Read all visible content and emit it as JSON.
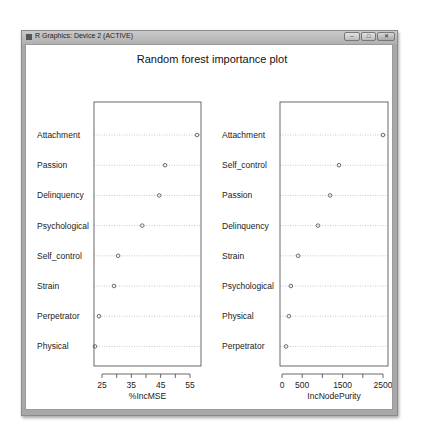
{
  "window": {
    "title": "R Graphics: Device 2 (ACTIVE)",
    "buttons": {
      "minimize": "–",
      "maximize": "□",
      "close": "✕"
    }
  },
  "chart_data": [
    {
      "type": "scatter",
      "subtype": "dotchart",
      "title": "Random forest importance plot",
      "xlabel": "%IncMSE",
      "ylabel": "",
      "categories": [
        "Attachment",
        "Passion",
        "Delinquency",
        "Psychological",
        "Self_control",
        "Strain",
        "Perpetrator",
        "Physical"
      ],
      "values": [
        57.4,
        46.5,
        44.5,
        38.7,
        30.5,
        29.1,
        24.0,
        22.6
      ],
      "xticks": [
        25,
        35,
        45,
        55
      ],
      "xminor": [
        30,
        40,
        50
      ],
      "xlim": [
        22,
        59
      ],
      "grid": "dotted horizontal"
    },
    {
      "type": "scatter",
      "subtype": "dotchart",
      "title": "Random forest importance plot",
      "xlabel": "IncNodePurity",
      "ylabel": "",
      "categories": [
        "Attachment",
        "Self_control",
        "Passion",
        "Delinquency",
        "Strain",
        "Psychological",
        "Physical",
        "Perpetrator"
      ],
      "values": [
        2500,
        1410,
        1190,
        890,
        400,
        220,
        170,
        100
      ],
      "xticks": [
        0,
        500,
        1500,
        2500
      ],
      "xminor": [
        1000,
        2000
      ],
      "xlim": [
        -50,
        2600
      ],
      "grid": "dotted horizontal"
    }
  ],
  "plot": {
    "title": "Random forest importance plot",
    "left": {
      "xlabel": "%IncMSE",
      "ticklabels": [
        "25",
        "35",
        "45",
        "55"
      ]
    },
    "right": {
      "xlabel": "IncNodePurity",
      "ticklabels": [
        "0",
        "500",
        "1500",
        "2500"
      ]
    }
  }
}
